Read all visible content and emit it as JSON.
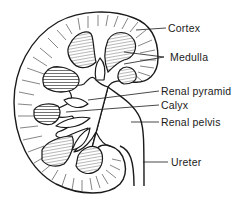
{
  "diagram": {
    "labels": [
      {
        "id": "cortex",
        "text": "Cortex",
        "x": 168,
        "y": 22
      },
      {
        "id": "medulla",
        "text": "Medulla",
        "x": 170,
        "y": 51
      },
      {
        "id": "renal-pyramid",
        "text": "Renal pyramid",
        "x": 161,
        "y": 85
      },
      {
        "id": "calyx",
        "text": "Calyx",
        "x": 161,
        "y": 99
      },
      {
        "id": "renal-pelvis",
        "text": "Renal pelvis",
        "x": 161,
        "y": 116
      },
      {
        "id": "ureter",
        "text": "Ureter",
        "x": 171,
        "y": 156
      }
    ],
    "colors": {
      "line": "#1a1a1a",
      "background": "#ffffff"
    }
  }
}
